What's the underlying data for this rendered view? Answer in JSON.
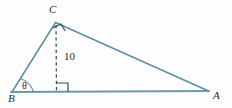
{
  "figure": {
    "type": "geometry-diagram",
    "background_color": "#fdfdfd",
    "stroke_color": "#5a8fa3",
    "text_color": "#2b2b2b",
    "vertices": [
      {
        "name": "A",
        "label": "A",
        "x": 208,
        "y": 91,
        "label_x": 213,
        "label_y": 90
      },
      {
        "name": "B",
        "label": "B",
        "x": 12,
        "y": 92,
        "label_x": 8,
        "label_y": 93
      },
      {
        "name": "C",
        "label": "C",
        "x": 55,
        "y": 22,
        "label_x": 49,
        "label_y": 4
      }
    ],
    "angles": [
      {
        "at": "B",
        "label": "θ",
        "type": "arc",
        "label_x": 22,
        "label_y": 81
      },
      {
        "at": "C",
        "label": "",
        "type": "right-angle-square",
        "rotated": true
      },
      {
        "at": "foot-of-altitude",
        "label": "",
        "type": "right-angle-square",
        "rotated": false
      }
    ],
    "segments": [
      {
        "name": "base-BA",
        "from": "B",
        "to": "A",
        "style": "solid"
      },
      {
        "name": "side-BC",
        "from": "B",
        "to": "C",
        "style": "solid"
      },
      {
        "name": "side-CA",
        "from": "C",
        "to": "A",
        "style": "solid"
      },
      {
        "name": "altitude-CD",
        "from": "C",
        "to": "foot-of-altitude",
        "style": "dashed"
      }
    ],
    "measurements": [
      {
        "name": "altitude-length",
        "value": "10",
        "label_x": 64,
        "label_y": 51
      }
    ]
  }
}
